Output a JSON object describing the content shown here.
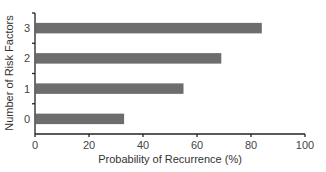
{
  "chart_data": {
    "type": "bar",
    "orientation": "horizontal",
    "title": "",
    "categories": [
      "0",
      "1",
      "2",
      "3"
    ],
    "values": [
      33,
      55,
      69,
      84
    ],
    "xlabel": "Probability of Recurrence (%)",
    "ylabel": "Number of Risk Factors",
    "xlim": [
      0,
      100
    ],
    "xticks": [
      0,
      20,
      40,
      60,
      80,
      100
    ],
    "grid": false,
    "legend": null,
    "bar_color": "#6d6d6d"
  },
  "axes": {
    "xlabel": "Probability of Recurrence (%)",
    "ylabel": "Number of Risk Factors",
    "xtick_labels": [
      "0",
      "20",
      "40",
      "60",
      "80",
      "100"
    ],
    "ytick_labels": [
      "0",
      "1",
      "2",
      "3"
    ]
  }
}
